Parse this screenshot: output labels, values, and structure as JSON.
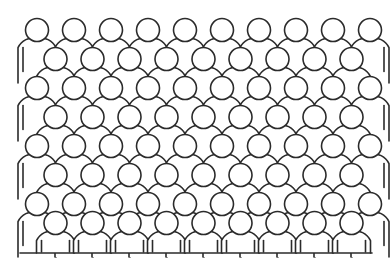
{
  "image": {
    "title": "Crowd of people pictogram",
    "description": "A dense crowd illustrated as repeated simplified human figures, each a circular head above a rounded-shoulder torso, arranged in overlapping staggered rows.",
    "subject": "crowd-of-people",
    "style": "line-art-outline",
    "icon_name": "person-pictogram"
  },
  "canvas": {
    "width": 390,
    "height": 267,
    "background_color": "#ffffff",
    "stroke_color": "#2b2b2b",
    "fill_color": "#ffffff",
    "stroke_width": 1.6
  },
  "crowd": {
    "total_figures": 76,
    "row_count": 8,
    "rows_per_count_pattern": "alternating 10 and 9 figures",
    "rows": [
      {
        "index": 0,
        "figure_count": 10,
        "offset": "aligned",
        "head_center_y": 30,
        "has_visible_arms": false
      },
      {
        "index": 1,
        "figure_count": 9,
        "offset": "staggered",
        "head_center_y": 59,
        "has_visible_arms": false
      },
      {
        "index": 2,
        "figure_count": 10,
        "offset": "aligned",
        "head_center_y": 88,
        "has_visible_arms": false
      },
      {
        "index": 3,
        "figure_count": 9,
        "offset": "staggered",
        "head_center_y": 117,
        "has_visible_arms": false
      },
      {
        "index": 4,
        "figure_count": 10,
        "offset": "aligned",
        "head_center_y": 146,
        "has_visible_arms": false
      },
      {
        "index": 5,
        "figure_count": 9,
        "offset": "staggered",
        "head_center_y": 175,
        "has_visible_arms": false
      },
      {
        "index": 6,
        "figure_count": 10,
        "offset": "aligned",
        "head_center_y": 204,
        "has_visible_arms": false
      },
      {
        "index": 7,
        "figure_count": 9,
        "offset": "staggered",
        "head_center_y": 223,
        "has_visible_arms": true
      }
    ],
    "geometry": {
      "left_margin": 20,
      "right_margin": 372,
      "column_pitch_x": 37,
      "row_pitch_y": 29,
      "head_radius": 11.5,
      "body_half_width": 19,
      "body_shoulder_radius": 17,
      "first_head_center_x": 37,
      "baseline_y": 253,
      "top_head_y": 18
    },
    "edge_figures_with_arms": {
      "left_column_rows": [
        0,
        2,
        4,
        6
      ],
      "right_column_rows": [
        0,
        2,
        4,
        6
      ],
      "bottom_row_all": true,
      "arm_line_length": 24
    }
  },
  "labels": {
    "figure_label": "person",
    "group_label": "crowd"
  }
}
